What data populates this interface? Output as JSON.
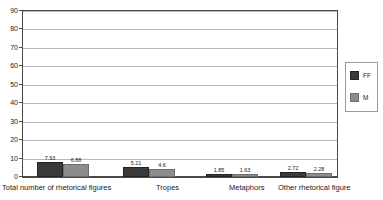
{
  "chart_data": {
    "type": "bar",
    "title": "",
    "subtitle": "",
    "xlabel": "",
    "ylabel": "",
    "ylim": [
      0,
      90
    ],
    "ytick_step": 10,
    "yticks": [
      "90",
      "80",
      "70",
      "60",
      "50",
      "40",
      "30",
      "20",
      "10",
      "0"
    ],
    "grid": "horizontal",
    "legend_position": "right",
    "categories": [
      "Total number of rhetorical figures",
      "Tropes",
      "Metaphors",
      "Other rhetorical figure"
    ],
    "series": [
      {
        "name": "FF",
        "color": "#3a3a3a",
        "values": [
          7.93,
          5.21,
          1.85,
          2.72
        ],
        "labels": [
          "7.93",
          "5.21",
          "1.85",
          "2.72"
        ]
      },
      {
        "name": "M",
        "color": "#8c8c8c",
        "values": [
          6.88,
          4.6,
          1.63,
          2.28
        ],
        "labels": [
          "6.88",
          "4.6",
          "1.63",
          "2.28"
        ]
      }
    ]
  },
  "legend": {
    "entries": [
      {
        "label": "FF",
        "swatch": "ff"
      },
      {
        "label": "M",
        "swatch": "m"
      }
    ]
  },
  "colors": {
    "series_ff": "#3a3a3a",
    "series_m": "#8c8c8c",
    "gridline": "#b9b9b9",
    "axis": "#4a4a4a",
    "background": "#ffffff"
  }
}
